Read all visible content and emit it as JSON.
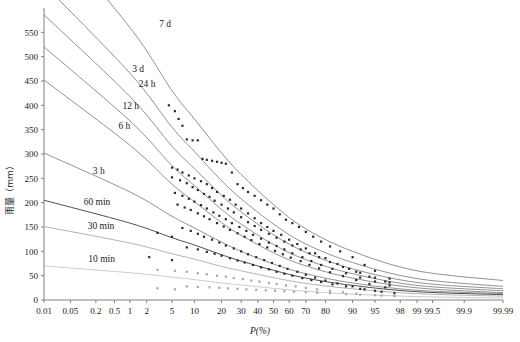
{
  "chart_data": {
    "type": "line",
    "title": "",
    "xlabel": "P(%)",
    "ylabel": "雨量（mm）",
    "xscale": "probability",
    "grid": false,
    "legend_position": "inline-curve-labels",
    "xlim": [
      0.01,
      99.99
    ],
    "ylim": [
      0,
      600
    ],
    "xticks": [
      "0.01",
      "0.05",
      "0.2",
      "0.5",
      "1",
      "2",
      "5",
      "10",
      "20",
      "30",
      "40",
      "50",
      "60",
      "70",
      "80",
      "90",
      "95",
      "98",
      "99",
      "99.5",
      "99.9",
      "99.99"
    ],
    "xtick_values": [
      0.01,
      0.05,
      0.2,
      0.5,
      1,
      2,
      5,
      10,
      20,
      30,
      40,
      50,
      60,
      70,
      80,
      90,
      95,
      98,
      99,
      99.5,
      99.9,
      99.99
    ],
    "yticks": [
      "0",
      "50",
      "100",
      "150",
      "200",
      "250",
      "300",
      "350",
      "400",
      "450",
      "500",
      "550"
    ],
    "ytick_values": [
      0,
      50,
      100,
      150,
      200,
      250,
      300,
      350,
      400,
      450,
      500,
      550
    ],
    "series": [
      {
        "name": "7 d",
        "label": "7 d",
        "color": "#6d6d6d",
        "label_x": 3.2,
        "label_y": 560,
        "anchor_p": [
          0.01,
          1,
          5,
          10,
          20,
          30,
          50,
          70,
          90,
          99,
          99.99
        ],
        "values": [
          770,
          560,
          430,
          372,
          302,
          258,
          196,
          146,
          100,
          60,
          40
        ]
      },
      {
        "name": "3 d",
        "label": "3 d",
        "color": "#6d6d6d",
        "label_x": 1.1,
        "label_y": 468,
        "anchor_p": [
          0.01,
          1,
          5,
          10,
          20,
          30,
          50,
          70,
          90,
          99,
          99.99
        ],
        "values": [
          648,
          466,
          355,
          305,
          245,
          208,
          156,
          115,
          77,
          44,
          28
        ]
      },
      {
        "name": "24 h",
        "label": "24 h",
        "color": "#6d6d6d",
        "label_x": 1.45,
        "label_y": 438,
        "anchor_p": [
          0.01,
          1,
          5,
          10,
          20,
          30,
          50,
          70,
          90,
          99,
          99.99
        ],
        "values": [
          586,
          418,
          316,
          270,
          215,
          181,
          134,
          98,
          64,
          36,
          23
        ]
      },
      {
        "name": "12 h",
        "label": "12 h",
        "color": "#6d6d6d",
        "label_x": 0.72,
        "label_y": 392,
        "anchor_p": [
          0.01,
          1,
          5,
          10,
          20,
          30,
          50,
          70,
          90,
          99,
          99.99
        ],
        "values": [
          520,
          368,
          276,
          235,
          186,
          156,
          114,
          83,
          54,
          30,
          19
        ]
      },
      {
        "name": "6 h",
        "label": "6 h",
        "color": "#6d6d6d",
        "label_x": 0.6,
        "label_y": 352,
        "anchor_p": [
          0.01,
          1,
          5,
          10,
          20,
          30,
          50,
          70,
          90,
          99,
          99.99
        ],
        "values": [
          452,
          318,
          238,
          202,
          159,
          133,
          97,
          70,
          45,
          25,
          15
        ]
      },
      {
        "name": "3 h",
        "label": "3 h",
        "color": "#6d6d6d",
        "label_x": 0.17,
        "label_y": 258,
        "anchor_p": [
          0.01,
          1,
          5,
          10,
          20,
          30,
          50,
          70,
          90,
          99,
          99.99
        ],
        "values": [
          302,
          222,
          172,
          148,
          119,
          100,
          74,
          54,
          35,
          20,
          13
        ]
      },
      {
        "name": "60 min",
        "label": "60 min",
        "color": "#3a3a3a",
        "label_x": 0.105,
        "label_y": 196,
        "anchor_p": [
          0.01,
          1,
          5,
          10,
          20,
          30,
          50,
          70,
          90,
          99,
          99.99
        ],
        "values": [
          205,
          158,
          128,
          113,
          93,
          80,
          61,
          45,
          30,
          17,
          11
        ]
      },
      {
        "name": "30 min",
        "label": "30 min",
        "color": "#9a9a9a",
        "label_x": 0.13,
        "label_y": 146,
        "anchor_p": [
          0.01,
          1,
          5,
          10,
          20,
          30,
          50,
          70,
          90,
          99,
          99.99
        ],
        "values": [
          151,
          117,
          95,
          84,
          69,
          60,
          46,
          34,
          23,
          13,
          8
        ]
      },
      {
        "name": "10 min",
        "label": "10 min",
        "color": "#b9b9b9",
        "label_x": 0.135,
        "label_y": 78,
        "anchor_p": [
          0.01,
          1,
          5,
          10,
          20,
          30,
          50,
          70,
          90,
          99,
          99.99
        ],
        "values": [
          70,
          56,
          47,
          42,
          35,
          31,
          24,
          18,
          12,
          7,
          4
        ]
      }
    ],
    "scatter_note": "empirical frequency points plotted per duration series",
    "scatter_color_dark": "#2b2b2b",
    "scatter_color_light": "#a8a8a8",
    "scatter": [
      {
        "series": "7 d",
        "color": "#2b2b2b",
        "p": [
          4.5,
          5.5,
          6.2,
          7.0,
          8.0,
          9.5,
          11,
          12.5,
          14,
          16,
          18,
          20,
          22,
          25,
          28,
          31,
          34,
          38,
          42,
          46,
          50,
          54,
          58,
          62,
          66,
          70,
          74,
          78,
          82,
          86,
          90,
          93,
          95,
          97
        ],
        "v": [
          400,
          388,
          372,
          358,
          330,
          328,
          328,
          290,
          288,
          286,
          284,
          282,
          280,
          262,
          238,
          230,
          222,
          214,
          205,
          196,
          188,
          176,
          165,
          158,
          150,
          140,
          130,
          120,
          110,
          100,
          88,
          72,
          60,
          44
        ]
      },
      {
        "series": "3 d",
        "color": "#2b2b2b",
        "p": [
          5,
          6,
          7,
          8.5,
          10,
          12,
          14,
          16,
          18,
          21,
          24,
          27,
          30,
          34,
          38,
          42,
          46,
          50,
          55,
          60,
          65,
          70,
          75,
          80,
          85,
          89,
          92,
          95,
          97
        ],
        "v": [
          272,
          268,
          262,
          256,
          250,
          244,
          238,
          230,
          222,
          214,
          206,
          196,
          188,
          178,
          168,
          158,
          150,
          142,
          134,
          124,
          115,
          106,
          96,
          86,
          74,
          64,
          56,
          46,
          36
        ]
      },
      {
        "series": "24 h",
        "color": "#2b2b2b",
        "p": [
          5,
          6.5,
          8,
          9.5,
          11,
          13,
          15,
          17,
          20,
          23,
          26,
          30,
          34,
          38,
          42,
          47,
          52,
          57,
          62,
          67,
          72,
          77,
          82,
          87,
          91,
          94,
          96.5
        ],
        "v": [
          252,
          246,
          240,
          232,
          226,
          218,
          212,
          204,
          196,
          188,
          180,
          170,
          160,
          152,
          144,
          136,
          128,
          120,
          112,
          104,
          96,
          88,
          78,
          68,
          58,
          48,
          38
        ]
      },
      {
        "series": "12 h",
        "color": "#2b2b2b",
        "p": [
          5.5,
          7,
          8.5,
          10,
          12,
          14,
          16.5,
          19,
          22,
          25,
          29,
          33,
          37,
          42,
          47,
          52,
          57,
          62,
          68,
          73,
          78,
          83,
          88,
          92,
          95,
          97
        ],
        "v": [
          220,
          214,
          208,
          202,
          195,
          188,
          180,
          173,
          166,
          158,
          150,
          142,
          134,
          126,
          118,
          111,
          104,
          96,
          88,
          80,
          72,
          64,
          55,
          46,
          38,
          30
        ]
      },
      {
        "series": "6 h",
        "color": "#2b2b2b",
        "p": [
          6,
          7.5,
          9,
          11,
          13,
          15,
          18,
          21,
          24,
          28,
          32,
          36,
          41,
          46,
          51,
          56,
          61,
          67,
          72,
          77,
          82,
          87,
          91,
          94,
          96.5
        ],
        "v": [
          196,
          190,
          185,
          178,
          172,
          166,
          158,
          151,
          144,
          137,
          130,
          123,
          115,
          108,
          101,
          94,
          87,
          80,
          72,
          65,
          57,
          49,
          41,
          33,
          26
        ]
      },
      {
        "series": "3 h",
        "color": "#2b2b2b",
        "p": [
          3.0,
          5.0,
          7,
          9,
          11,
          13,
          16,
          19,
          22,
          26,
          30,
          34,
          39,
          44,
          49,
          54,
          59,
          65,
          70,
          75,
          80,
          85,
          90,
          93,
          96
        ],
        "v": [
          138,
          130,
          148,
          142,
          136,
          130,
          124,
          118,
          112,
          106,
          100,
          94,
          88,
          82,
          76,
          70,
          64,
          58,
          52,
          46,
          40,
          34,
          28,
          22,
          17
        ]
      },
      {
        "series": "60 min",
        "color": "#2b2b2b",
        "p": [
          2.2,
          5,
          8,
          11,
          14,
          17,
          20,
          24,
          28,
          32,
          37,
          42,
          47,
          52,
          57,
          62,
          68,
          73,
          78,
          83,
          88,
          92,
          95,
          97.5
        ],
        "v": [
          88,
          82,
          108,
          104,
          99,
          95,
          91,
          86,
          81,
          77,
          72,
          67,
          63,
          58,
          54,
          50,
          45,
          41,
          37,
          32,
          28,
          23,
          19,
          14
        ]
      },
      {
        "series": "30 min",
        "color": "#a8a8a8",
        "p": [
          3.0,
          5.5,
          8,
          11,
          14,
          18,
          22,
          26,
          31,
          36,
          41,
          47,
          52,
          58,
          64,
          70,
          76,
          82,
          87,
          91,
          95,
          97.5
        ],
        "v": [
          62,
          60,
          58,
          55,
          53,
          50,
          48,
          45,
          43,
          40,
          38,
          35,
          33,
          30,
          28,
          25,
          22,
          19,
          16,
          13,
          10,
          8
        ]
      },
      {
        "series": "10 min",
        "color": "#a8a8a8",
        "p": [
          3.0,
          5.5,
          8,
          11,
          15,
          19,
          23,
          28,
          33,
          39,
          45,
          51,
          57,
          63,
          70,
          76,
          82,
          88,
          92,
          96
        ],
        "v": [
          24,
          22,
          28,
          27,
          26,
          25,
          24,
          23,
          22,
          21,
          20,
          19,
          18,
          17,
          16,
          15,
          14,
          12,
          11,
          9
        ]
      }
    ]
  },
  "layout": {
    "plot_left": 44,
    "plot_right": 503,
    "plot_top": 8,
    "plot_bottom": 300
  }
}
